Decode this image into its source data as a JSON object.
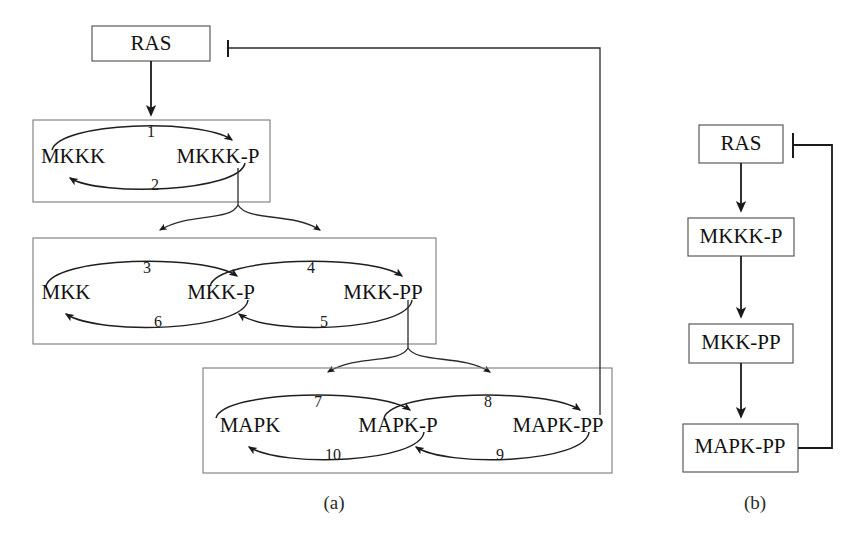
{
  "figure": {
    "type": "biochemical-pathway-diagram",
    "panels": [
      {
        "id": "a",
        "caption": "(a)",
        "title": "Detailed MAPK cascade with phosphorylation cycles"
      },
      {
        "id": "b",
        "caption": "(b)",
        "title": "Reduced MAPK cascade"
      }
    ]
  },
  "panel_a": {
    "caption": "(a)",
    "input_node": {
      "label": "RAS"
    },
    "tiers": [
      {
        "id": "tier-mkkk",
        "species": [
          {
            "label": "MKKK"
          },
          {
            "label": "MKKK-P"
          }
        ],
        "reactions": [
          {
            "number": "1",
            "from": "MKKK",
            "to": "MKKK-P",
            "direction": "forward"
          },
          {
            "number": "2",
            "from": "MKKK-P",
            "to": "MKKK",
            "direction": "reverse"
          }
        ]
      },
      {
        "id": "tier-mkk",
        "species": [
          {
            "label": "MKK"
          },
          {
            "label": "MKK-P"
          },
          {
            "label": "MKK-PP"
          }
        ],
        "reactions": [
          {
            "number": "3",
            "from": "MKK",
            "to": "MKK-P",
            "direction": "forward"
          },
          {
            "number": "4",
            "from": "MKK-P",
            "to": "MKK-PP",
            "direction": "forward"
          },
          {
            "number": "5",
            "from": "MKK-PP",
            "to": "MKK-P",
            "direction": "reverse"
          },
          {
            "number": "6",
            "from": "MKK-P",
            "to": "MKK",
            "direction": "reverse"
          }
        ]
      },
      {
        "id": "tier-mapk",
        "species": [
          {
            "label": "MAPK"
          },
          {
            "label": "MAPK-P"
          },
          {
            "label": "MAPK-PP"
          }
        ],
        "reactions": [
          {
            "number": "7",
            "from": "MAPK",
            "to": "MAPK-P",
            "direction": "forward"
          },
          {
            "number": "8",
            "from": "MAPK-P",
            "to": "MAPK-PP",
            "direction": "forward"
          },
          {
            "number": "9",
            "from": "MAPK-PP",
            "to": "MAPK-P",
            "direction": "reverse"
          },
          {
            "number": "10",
            "from": "MAPK-P",
            "to": "MAPK",
            "direction": "reverse"
          }
        ]
      }
    ],
    "connections": [
      {
        "kind": "activation",
        "from": "RAS",
        "to": "reaction-1"
      },
      {
        "kind": "activation",
        "from": "MKKK-P",
        "to": "reaction-3"
      },
      {
        "kind": "activation",
        "from": "MKKK-P",
        "to": "reaction-4"
      },
      {
        "kind": "activation",
        "from": "MKK-PP",
        "to": "reaction-7"
      },
      {
        "kind": "activation",
        "from": "MKK-PP",
        "to": "reaction-8"
      },
      {
        "kind": "inhibition",
        "from": "MAPK-PP",
        "to": "RAS"
      }
    ]
  },
  "panel_b": {
    "caption": "(b)",
    "nodes": [
      {
        "label": "RAS"
      },
      {
        "label": "MKKK-P"
      },
      {
        "label": "MKK-PP"
      },
      {
        "label": "MAPK-PP"
      }
    ],
    "connections": [
      {
        "kind": "activation",
        "from": "RAS",
        "to": "MKKK-P"
      },
      {
        "kind": "activation",
        "from": "MKKK-P",
        "to": "MKK-PP"
      },
      {
        "kind": "activation",
        "from": "MKK-PP",
        "to": "MAPK-PP"
      },
      {
        "kind": "inhibition",
        "from": "MAPK-PP",
        "to": "RAS"
      }
    ]
  },
  "colors": {
    "stroke": "#1a1a1a",
    "tier_border": "#7a7a7a",
    "node_border": "#5a5a5a",
    "background": "#ffffff",
    "text": "#111111"
  }
}
